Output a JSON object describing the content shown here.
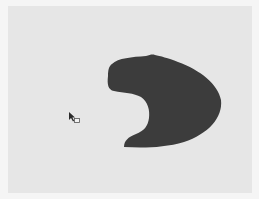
{
  "scene": {
    "background_color": "#e6e6e6",
    "margin_color": "#f5f5f5",
    "shape": {
      "name": "dark-crescent-blob",
      "fill_color": "#3c3c3c"
    },
    "cursor": {
      "type": "arrow-with-drag-box",
      "color": "#2a2a2a"
    }
  }
}
